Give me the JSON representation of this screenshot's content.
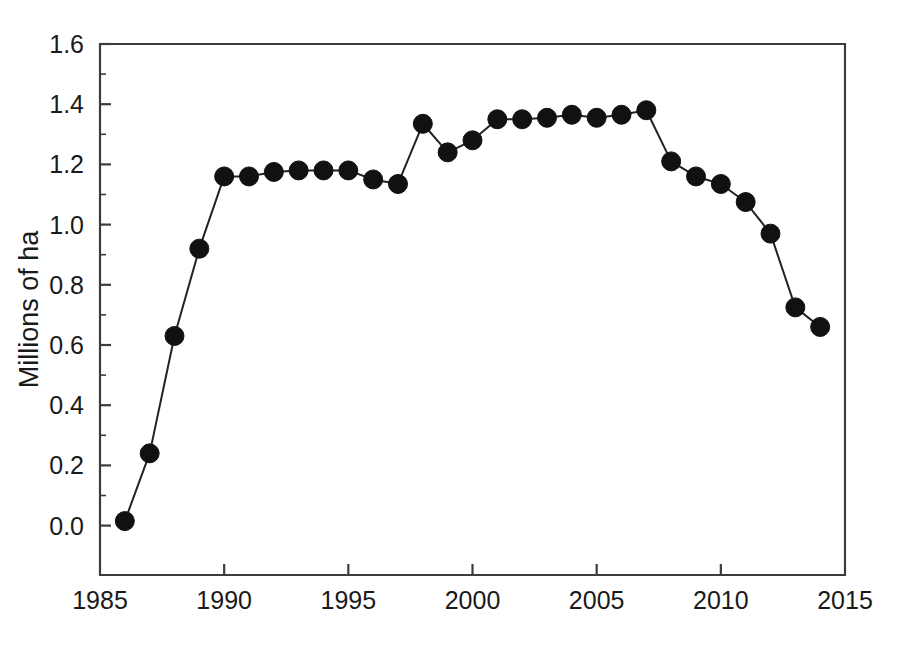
{
  "chart_data": {
    "type": "line",
    "title": "",
    "subtitle": "",
    "xlabel": "",
    "ylabel": "Millions of ha",
    "xlim": [
      1985,
      2015
    ],
    "ylim": [
      -0.16,
      1.6
    ],
    "grid": false,
    "legend": null,
    "marker": "filled-circle",
    "line_color": "#222222",
    "marker_color": "#111111",
    "x_ticks": [
      "1985",
      "1990",
      "1995",
      "2000",
      "2005",
      "2010",
      "2015"
    ],
    "x_tick_values": [
      1985,
      1990,
      1995,
      2000,
      2005,
      2010,
      2015
    ],
    "x_minor_interval": 1,
    "y_ticks": [
      "0.0",
      "0.2",
      "0.4",
      "0.6",
      "0.8",
      "1.0",
      "1.2",
      "1.4",
      "1.6"
    ],
    "y_tick_values": [
      0.0,
      0.2,
      0.4,
      0.6,
      0.8,
      1.0,
      1.2,
      1.4,
      1.6
    ],
    "y_minor_interval": 0.1,
    "x": [
      1986,
      1987,
      1988,
      1989,
      1990,
      1991,
      1992,
      1993,
      1994,
      1995,
      1996,
      1997,
      1998,
      1999,
      2000,
      2001,
      2002,
      2003,
      2004,
      2005,
      2006,
      2007,
      2008,
      2009,
      2010,
      2011,
      2012,
      2013,
      2014
    ],
    "values": [
      0.015,
      0.24,
      0.63,
      0.92,
      1.16,
      1.16,
      1.175,
      1.18,
      1.18,
      1.18,
      1.15,
      1.135,
      1.335,
      1.24,
      1.28,
      1.35,
      1.35,
      1.355,
      1.365,
      1.355,
      1.365,
      1.38,
      1.21,
      1.16,
      1.135,
      1.075,
      0.97,
      0.725,
      0.66
    ],
    "series": [
      {
        "name": "Millions of ha",
        "x": [
          1986,
          1987,
          1988,
          1989,
          1990,
          1991,
          1992,
          1993,
          1994,
          1995,
          1996,
          1997,
          1998,
          1999,
          2000,
          2001,
          2002,
          2003,
          2004,
          2005,
          2006,
          2007,
          2008,
          2009,
          2010,
          2011,
          2012,
          2013,
          2014
        ],
        "values": [
          0.015,
          0.24,
          0.63,
          0.92,
          1.16,
          1.16,
          1.175,
          1.18,
          1.18,
          1.18,
          1.15,
          1.135,
          1.335,
          1.24,
          1.28,
          1.35,
          1.35,
          1.355,
          1.365,
          1.355,
          1.365,
          1.38,
          1.21,
          1.16,
          1.135,
          1.075,
          0.97,
          0.725,
          0.66
        ]
      }
    ]
  },
  "plot_geometry": {
    "left": 100,
    "right": 845,
    "top": 44,
    "bottom": 575,
    "y_value_top": 1.6,
    "y_value_bottom": -0.1641,
    "x_value_left": 1985,
    "x_value_right": 2015,
    "marker_radius": 9.5
  }
}
